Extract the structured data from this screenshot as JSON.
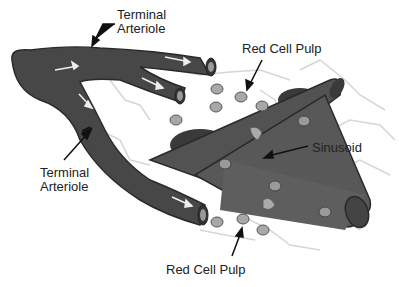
{
  "diagram": {
    "type": "anatomical illustration",
    "colors": {
      "vessel": "#4a4a4a",
      "vessel_dark": "#2e2e2e",
      "sinusoid": "#5a5a5a",
      "cell_fill": "#a8a8a8",
      "reticulum": "#d8d8d8",
      "text": "#222222",
      "background": "#ffffff"
    },
    "labels": {
      "top_arteriole_line1": "Terminal",
      "top_arteriole_line2": "Arteriole",
      "left_arteriole_line1": "Terminal",
      "left_arteriole_line2": "Arteriole",
      "red_pulp_top": "Red Cell Pulp",
      "sinusoid": "Sinusoid",
      "red_pulp_bottom": "Red Cell Pulp"
    }
  }
}
